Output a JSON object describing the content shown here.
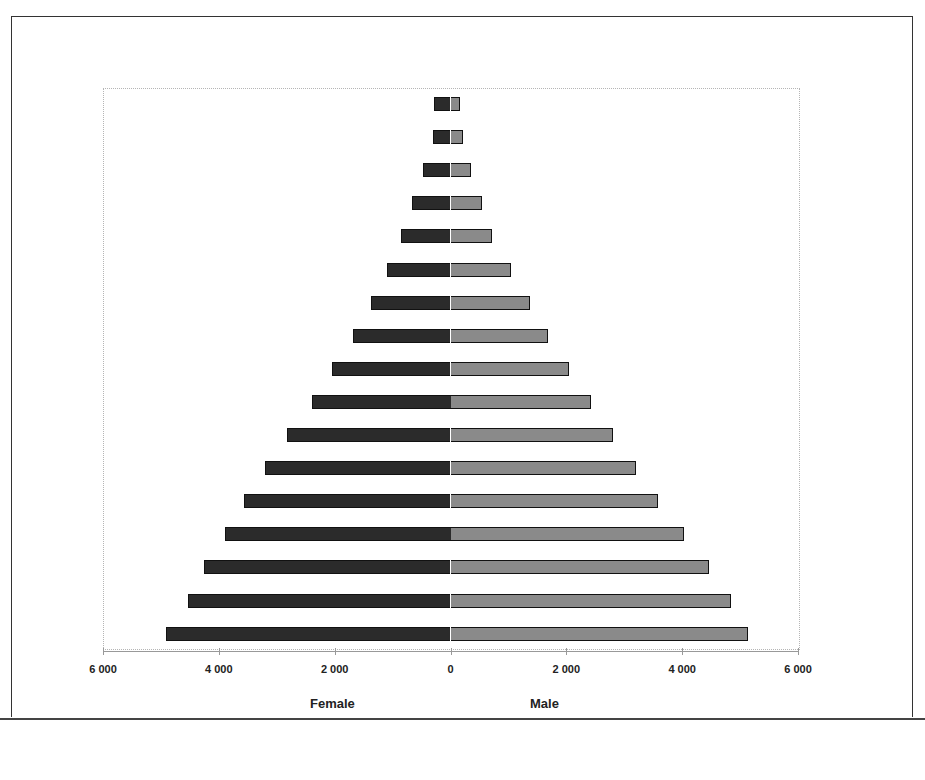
{
  "chart_data": {
    "type": "bar",
    "orientation": "horizontal",
    "subtype": "population-pyramid",
    "title": "",
    "xlabel": "",
    "ylabel": "",
    "xlim": [
      -6000,
      6000
    ],
    "x_tick_labels": [
      "6 000",
      "4 000",
      "2 000",
      "0",
      "2 000",
      "4 000",
      "6 000"
    ],
    "x_tick_values": [
      -6000,
      -4000,
      -2000,
      0,
      2000,
      4000,
      6000
    ],
    "group_labels": {
      "left": "Female",
      "right": "Male"
    },
    "grid": false,
    "legend": null,
    "categories_note": "17 age bands, top = oldest, bottom = youngest (labels not shown)",
    "series": [
      {
        "name": "Female",
        "color": "#2b2b2b",
        "side": "left",
        "values": [
          290,
          310,
          470,
          660,
          860,
          1090,
          1380,
          1690,
          2040,
          2400,
          2820,
          3200,
          3570,
          3900,
          4250,
          4530,
          4910
        ]
      },
      {
        "name": "Male",
        "color": "#8a8a8a",
        "side": "right",
        "values": [
          160,
          210,
          360,
          540,
          720,
          1040,
          1380,
          1690,
          2050,
          2420,
          2800,
          3200,
          3590,
          4040,
          4470,
          4840,
          5140
        ]
      }
    ]
  }
}
